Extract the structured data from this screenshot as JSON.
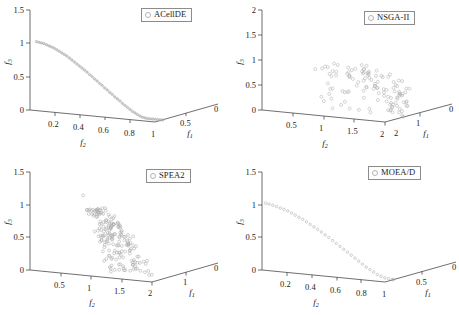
{
  "figure": {
    "panels": [
      {
        "id": "acellde",
        "legend_label": "ACellDE",
        "marker": "open-circle",
        "axis": {
          "z_label": "f3",
          "x_label": "f2",
          "y_label": "f1",
          "z_ticks": [
            "0",
            "0.5",
            "1",
            "1.5"
          ],
          "x_ticks": [
            "0.2",
            "0.4",
            "0.6",
            "0.8",
            "1"
          ],
          "y_ticks": [
            "0.5",
            "0"
          ],
          "z_origin_tick": "0"
        }
      },
      {
        "id": "nsga2",
        "legend_label": "NSGA-II",
        "marker": "open-circle",
        "axis": {
          "z_label": "f3",
          "x_label": "f2",
          "y_label": "f1",
          "z_ticks": [
            "0",
            "0.5",
            "1",
            "1.5",
            "2"
          ],
          "x_ticks": [
            "0.5",
            "1",
            "1.5",
            "2"
          ],
          "y_ticks": [
            "2",
            "1",
            "0"
          ],
          "z_origin_tick": "0"
        }
      },
      {
        "id": "spea2",
        "legend_label": "SPEA2",
        "marker": "open-circle",
        "axis": {
          "z_label": "f3",
          "x_label": "f2",
          "y_label": "f1",
          "z_ticks": [
            "0",
            "0.5",
            "1",
            "1.5"
          ],
          "x_ticks": [
            "0.5",
            "1",
            "1.5",
            "2"
          ],
          "y_ticks": [
            "1",
            "0"
          ],
          "z_origin_tick": "0"
        }
      },
      {
        "id": "moead",
        "legend_label": "MOEA/D",
        "marker": "open-circle",
        "axis": {
          "z_label": "f3",
          "x_label": "f2",
          "y_label": "f1",
          "z_ticks": [
            "0",
            "0.5",
            "1",
            "1.5"
          ],
          "x_ticks": [
            "0.2",
            "0.4",
            "0.6",
            "0.8",
            "1"
          ],
          "y_ticks": [
            "0.5",
            "0"
          ],
          "z_origin_tick": "0"
        }
      }
    ]
  },
  "chart_data": [
    {
      "type": "scatter",
      "id": "acellde",
      "title": "ACellDE",
      "xlabel": "f2",
      "ylabel": "f1",
      "zlabel": "f3",
      "xlim": [
        0,
        1
      ],
      "ylim": [
        0,
        1
      ],
      "zlim": [
        0,
        1.5
      ],
      "legend": [
        "ACellDE"
      ],
      "legend_position": "top-right",
      "grid": false,
      "description": "Dense continuous arc of tiny open circles forming a smooth quarter-circle Pareto front from (f3=1.5, top) down to the f2=1 corner.",
      "points": [
        [
          0.0,
          1.0,
          1.5
        ],
        [
          0.02,
          0.999,
          1.49
        ],
        [
          0.04,
          0.998,
          1.48
        ],
        [
          0.06,
          0.996,
          1.47
        ],
        [
          0.08,
          0.993,
          1.45
        ],
        [
          0.1,
          0.99,
          1.43
        ],
        [
          0.12,
          0.986,
          1.41
        ],
        [
          0.14,
          0.982,
          1.39
        ],
        [
          0.16,
          0.977,
          1.36
        ],
        [
          0.18,
          0.971,
          1.33
        ],
        [
          0.2,
          0.964,
          1.3
        ],
        [
          0.22,
          0.957,
          1.27
        ],
        [
          0.24,
          0.949,
          1.24
        ],
        [
          0.26,
          0.941,
          1.2
        ],
        [
          0.28,
          0.932,
          1.16
        ],
        [
          0.3,
          0.922,
          1.12
        ],
        [
          0.32,
          0.911,
          1.08
        ],
        [
          0.34,
          0.9,
          1.04
        ],
        [
          0.36,
          0.888,
          1.0
        ],
        [
          0.38,
          0.876,
          0.96
        ],
        [
          0.4,
          0.862,
          0.92
        ],
        [
          0.42,
          0.848,
          0.87
        ],
        [
          0.44,
          0.834,
          0.83
        ],
        [
          0.46,
          0.818,
          0.78
        ],
        [
          0.48,
          0.802,
          0.74
        ],
        [
          0.5,
          0.785,
          0.69
        ],
        [
          0.52,
          0.768,
          0.65
        ],
        [
          0.54,
          0.749,
          0.6
        ],
        [
          0.56,
          0.73,
          0.56
        ],
        [
          0.58,
          0.711,
          0.51
        ],
        [
          0.6,
          0.69,
          0.47
        ],
        [
          0.62,
          0.669,
          0.42
        ],
        [
          0.64,
          0.647,
          0.38
        ],
        [
          0.66,
          0.624,
          0.34
        ],
        [
          0.68,
          0.601,
          0.29
        ],
        [
          0.7,
          0.577,
          0.25
        ],
        [
          0.72,
          0.552,
          0.21
        ],
        [
          0.74,
          0.527,
          0.17
        ],
        [
          0.76,
          0.5,
          0.13
        ],
        [
          0.78,
          0.473,
          0.1
        ],
        [
          0.8,
          0.445,
          0.07
        ],
        [
          0.82,
          0.417,
          0.04
        ],
        [
          0.84,
          0.387,
          0.02
        ],
        [
          0.86,
          0.357,
          0.01
        ],
        [
          0.88,
          0.326,
          0.0
        ],
        [
          0.9,
          0.294,
          0.0
        ],
        [
          0.92,
          0.262,
          0.0
        ],
        [
          0.94,
          0.229,
          0.0
        ],
        [
          0.96,
          0.195,
          0.0
        ],
        [
          0.98,
          0.16,
          0.0
        ],
        [
          1.0,
          0.125,
          0.0
        ]
      ]
    },
    {
      "type": "scatter",
      "id": "nsga2",
      "title": "NSGA-II",
      "xlabel": "f2",
      "ylabel": "f1",
      "zlabel": "f3",
      "xlim": [
        0,
        2
      ],
      "ylim": [
        0,
        2
      ],
      "zlim": [
        0,
        2
      ],
      "legend": [
        "NSGA-II"
      ],
      "legend_position": "top-right",
      "grid": false,
      "description": "Widely scattered sparse open circles spread over a broad region, poorly converged front with large spread in all three objectives.",
      "n_points": 96
    },
    {
      "type": "scatter",
      "id": "spea2",
      "title": "SPEA2",
      "xlabel": "f2",
      "ylabel": "f1",
      "zlabel": "f3",
      "xlim": [
        0,
        2
      ],
      "ylim": [
        0,
        1
      ],
      "zlim": [
        0,
        1.5
      ],
      "legend": [
        "SPEA2"
      ],
      "legend_position": "top-right",
      "grid": false,
      "description": "Dense broad band of open circles forming a thick curved strip, wider spread than ACellDE but more clustered than NSGA-II.",
      "n_points": 190
    },
    {
      "type": "scatter",
      "id": "moead",
      "title": "MOEA/D",
      "xlabel": "f2",
      "ylabel": "f1",
      "zlabel": "f3",
      "xlim": [
        0,
        1
      ],
      "ylim": [
        0,
        1
      ],
      "zlim": [
        0,
        1.5
      ],
      "legend": [
        "MOEA/D"
      ],
      "legend_position": "top-right",
      "grid": false,
      "description": "Thin arc of slightly spaced open circles tracing a quarter-circle Pareto front, with one isolated outlier point at the upper left.",
      "points": [
        [
          0.0,
          1.0,
          1.47
        ],
        [
          0.03,
          0.999,
          1.45
        ],
        [
          0.06,
          0.996,
          1.43
        ],
        [
          0.09,
          0.992,
          1.4
        ],
        [
          0.12,
          0.986,
          1.38
        ],
        [
          0.15,
          0.979,
          1.35
        ],
        [
          0.18,
          0.971,
          1.31
        ],
        [
          0.21,
          0.961,
          1.27
        ],
        [
          0.24,
          0.95,
          1.23
        ],
        [
          0.27,
          0.938,
          1.19
        ],
        [
          0.3,
          0.924,
          1.14
        ],
        [
          0.33,
          0.909,
          1.09
        ],
        [
          0.36,
          0.893,
          1.04
        ],
        [
          0.39,
          0.875,
          0.99
        ],
        [
          0.42,
          0.856,
          0.94
        ],
        [
          0.45,
          0.836,
          0.88
        ],
        [
          0.48,
          0.815,
          0.83
        ],
        [
          0.51,
          0.792,
          0.77
        ],
        [
          0.54,
          0.768,
          0.71
        ],
        [
          0.57,
          0.743,
          0.65
        ],
        [
          0.6,
          0.717,
          0.59
        ],
        [
          0.63,
          0.689,
          0.53
        ],
        [
          0.66,
          0.66,
          0.47
        ],
        [
          0.69,
          0.63,
          0.41
        ],
        [
          0.72,
          0.599,
          0.35
        ],
        [
          0.75,
          0.566,
          0.29
        ],
        [
          0.78,
          0.533,
          0.23
        ],
        [
          0.81,
          0.498,
          0.18
        ],
        [
          0.84,
          0.462,
          0.13
        ],
        [
          0.87,
          0.425,
          0.08
        ],
        [
          0.9,
          0.387,
          0.05
        ],
        [
          0.93,
          0.348,
          0.02
        ],
        [
          0.96,
          0.308,
          0.01
        ],
        [
          0.99,
          0.267,
          0.0
        ],
        [
          1.0,
          0.225,
          0.0
        ]
      ],
      "outlier": [
        0.02,
        0.99,
        1.47
      ]
    }
  ]
}
